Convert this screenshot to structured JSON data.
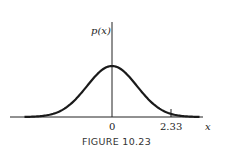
{
  "chart_data": {
    "type": "line",
    "title": "",
    "caption": "FIGURE 10.23",
    "xlabel": "x",
    "ylabel": "p(x)",
    "x_ticks": [
      "0",
      "2.33"
    ],
    "series": [
      {
        "name": "standard normal density p(x)",
        "x": [
          -3.5,
          -3,
          -2,
          -1,
          0,
          1,
          2,
          2.33,
          3,
          3.5
        ],
        "values": [
          0.0009,
          0.0044,
          0.054,
          0.242,
          0.399,
          0.242,
          0.054,
          0.026,
          0.0044,
          0.0009
        ]
      }
    ],
    "shaded_region": {
      "from": 2.33,
      "to": 3.5,
      "description": "right tail area beyond x = 2.33",
      "color": "#c8c8c8"
    },
    "grid": false,
    "legend": "none"
  },
  "labels": {
    "ylabel": "p(x)",
    "xlabel": "x",
    "tick_zero": "0",
    "tick_233": "2.33",
    "caption": "FIGURE 10.23"
  }
}
